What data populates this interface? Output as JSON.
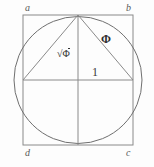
{
  "figure": {
    "colors": {
      "background": "#fdfdfd",
      "square_stroke": "#8a8a8a",
      "circle_stroke": "#6f6f6f",
      "triangle_stroke": "#8a8a8a",
      "axis_stroke": "#8a8a8a",
      "label_text": "#5a5a5a",
      "measure_text": "#3a3a3a"
    },
    "vertex_labels": {
      "top_left": "a",
      "top_right": "b",
      "bottom_right": "c",
      "bottom_left": "d"
    },
    "measure_labels": {
      "hypotenuse_left": "Φ",
      "hypotenuse_left_prefix": "√",
      "hypotenuse_right": "Φ",
      "base_half": "1"
    },
    "geometry": {
      "square": {
        "x": 23,
        "y": 15,
        "width": 110,
        "height": 130
      },
      "circle": {
        "cx": 78,
        "cy": 80,
        "r": 64
      },
      "triangle": {
        "apex": [
          78,
          15
        ],
        "left": [
          23,
          80
        ],
        "right": [
          133,
          80
        ]
      },
      "midlines": {
        "horizontal_y": 80,
        "vertical_x": 78
      }
    }
  }
}
